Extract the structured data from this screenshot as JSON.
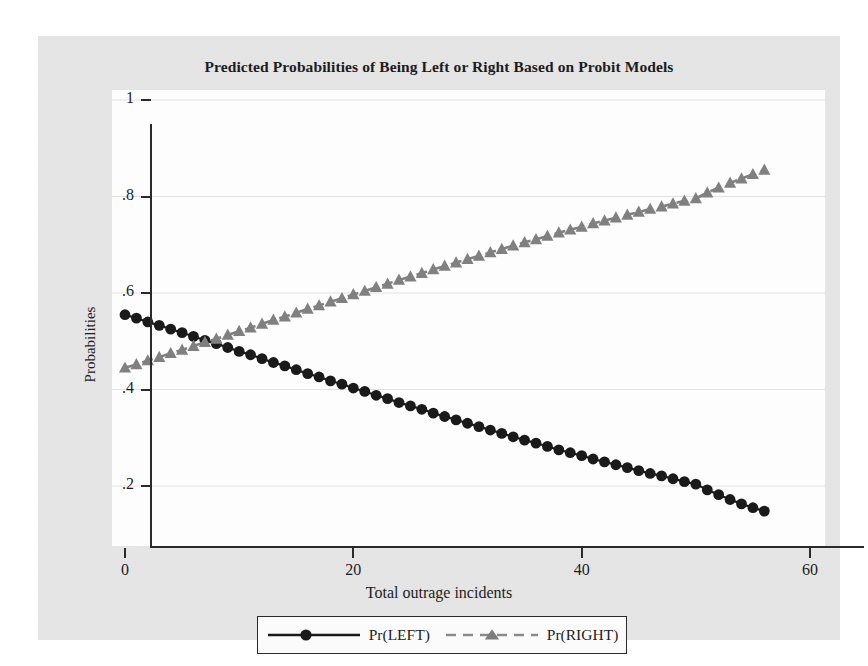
{
  "chart_data": {
    "type": "line",
    "title": "Predicted Probabilities of Being Left or Right Based on Probit Models",
    "xlabel": "Total outrage incidents",
    "ylabel": "Probabilities",
    "xlim": [
      0,
      60
    ],
    "ylim": [
      0.1,
      1.0
    ],
    "xticks": [
      "0",
      "20",
      "40",
      "60"
    ],
    "xtick_values": [
      0,
      20,
      40,
      60
    ],
    "yticks": [
      ".2",
      ".4",
      ".6",
      ".8",
      "1"
    ],
    "ytick_values": [
      0.2,
      0.4,
      0.6,
      0.8,
      1.0
    ],
    "grid": "horizontal",
    "legend_position": "below-plot",
    "x": [
      0,
      1,
      2,
      3,
      4,
      5,
      6,
      7,
      8,
      9,
      10,
      11,
      12,
      13,
      14,
      15,
      16,
      17,
      18,
      19,
      20,
      21,
      22,
      23,
      24,
      25,
      26,
      27,
      28,
      29,
      30,
      31,
      32,
      33,
      34,
      35,
      36,
      37,
      38,
      39,
      40,
      41,
      42,
      43,
      44,
      45,
      46,
      47,
      48,
      49,
      50,
      51,
      52,
      53,
      54,
      55,
      56
    ],
    "series": [
      {
        "name": "Pr(LEFT)",
        "marker": "circle",
        "linestyle": "solid",
        "color": "#1a1a1a",
        "values": [
          0.555,
          0.548,
          0.54,
          0.533,
          0.525,
          0.518,
          0.51,
          0.502,
          0.495,
          0.487,
          0.479,
          0.472,
          0.464,
          0.456,
          0.449,
          0.441,
          0.433,
          0.426,
          0.418,
          0.411,
          0.403,
          0.396,
          0.388,
          0.381,
          0.373,
          0.366,
          0.359,
          0.351,
          0.344,
          0.337,
          0.33,
          0.323,
          0.316,
          0.309,
          0.302,
          0.295,
          0.289,
          0.282,
          0.275,
          0.269,
          0.263,
          0.256,
          0.25,
          0.244,
          0.238,
          0.232,
          0.226,
          0.221,
          0.215,
          0.209,
          0.204,
          0.192,
          0.182,
          0.172,
          0.163,
          0.155,
          0.148
        ]
      },
      {
        "name": "Pr(RIGHT)",
        "marker": "triangle",
        "linestyle": "dashed",
        "color": "#808080",
        "values": [
          0.445,
          0.452,
          0.46,
          0.467,
          0.475,
          0.482,
          0.49,
          0.498,
          0.505,
          0.513,
          0.521,
          0.528,
          0.536,
          0.544,
          0.551,
          0.559,
          0.567,
          0.574,
          0.582,
          0.589,
          0.597,
          0.604,
          0.612,
          0.619,
          0.627,
          0.634,
          0.641,
          0.649,
          0.656,
          0.663,
          0.67,
          0.677,
          0.684,
          0.691,
          0.698,
          0.705,
          0.711,
          0.718,
          0.725,
          0.731,
          0.737,
          0.744,
          0.75,
          0.756,
          0.762,
          0.768,
          0.774,
          0.779,
          0.785,
          0.791,
          0.796,
          0.808,
          0.818,
          0.828,
          0.837,
          0.846,
          0.855
        ]
      }
    ]
  },
  "legend": {
    "entries": [
      {
        "label": "Pr(LEFT)"
      },
      {
        "label": "Pr(RIGHT)"
      }
    ]
  }
}
